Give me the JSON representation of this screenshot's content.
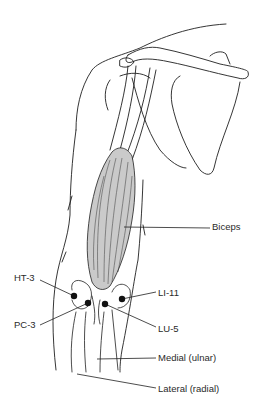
{
  "figure": {
    "colors": {
      "line": "#1f1f1f",
      "muscle_fill": "#c9c9c9",
      "muscle_fill_light": "#e2e2e2",
      "point": "#111111",
      "background": "#ffffff"
    }
  },
  "labels": {
    "biceps": "Biceps",
    "ht3": "HT-3",
    "pc3": "PC-3",
    "li11": "LI-11",
    "lu5": "LU-5",
    "medial": "Medial (ulnar)",
    "lateral": "Lateral (radial)"
  },
  "points": [
    {
      "id": "HT-3",
      "x": 74,
      "y": 296
    },
    {
      "id": "PC-3",
      "x": 88,
      "y": 303
    },
    {
      "id": "LU-5",
      "x": 105,
      "y": 304
    },
    {
      "id": "LI-11",
      "x": 122,
      "y": 299
    }
  ]
}
